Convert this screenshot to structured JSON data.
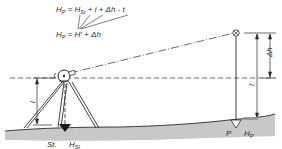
{
  "diagram": {
    "type": "surveying-height-determination",
    "formulas": {
      "line1": {
        "lhs": "H",
        "lhs_sub": "P",
        "eq": " = ",
        "t1": "H",
        "t1_sub": "St",
        "rest": " + i + Δh - t"
      },
      "line2": {
        "lhs": "H",
        "lhs_sub": "P",
        "eq": " = ",
        "t1": "H'",
        "rest": " + Δh"
      }
    },
    "labels": {
      "instrument_height": "i",
      "height_difference": "Δh",
      "target_height": "t",
      "station": "St.",
      "station_height": "H",
      "station_height_sub": "St",
      "point": "P",
      "point_height": "H",
      "point_height_sub": "P"
    },
    "colors": {
      "line": "#2a2a2a",
      "ground_fill": "#c8c8c8",
      "background": "#ffffff"
    }
  }
}
